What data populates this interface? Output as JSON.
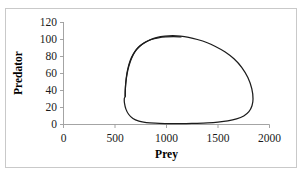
{
  "figure": {
    "border_color": "#c9c9c9",
    "background": "#ffffff"
  },
  "chart_data": {
    "type": "line",
    "title": "",
    "xlabel": "Prey",
    "ylabel": "Predator",
    "xlim": [
      0,
      2000
    ],
    "ylim": [
      0,
      120
    ],
    "xticks": [
      0,
      500,
      1000,
      1500,
      2000
    ],
    "yticks": [
      0,
      20,
      40,
      60,
      80,
      100,
      120
    ],
    "xtick_labels": [
      "0",
      "500",
      "1000",
      "1500",
      "2000"
    ],
    "ytick_labels": [
      "0",
      "20",
      "40",
      "60",
      "80",
      "100",
      "120"
    ],
    "grid": false,
    "legend": false,
    "line_color": "#1c1c1c",
    "series": [
      {
        "name": "predator-prey-limit-cycle",
        "x": [
          600,
          600,
          604,
          612,
          626,
          648,
          680,
          722,
          776,
          840,
          910,
          985,
          1060,
          1135,
          1215,
          1300,
          1390,
          1480,
          1570,
          1655,
          1730,
          1790,
          1828,
          1840,
          1830,
          1800,
          1750,
          1680,
          1595,
          1500,
          1400,
          1295,
          1190,
          1085,
          985,
          890,
          805,
          732,
          674,
          632,
          606,
          592,
          590,
          596,
          600
        ],
        "y": [
          33,
          40,
          48,
          57,
          66,
          75,
          83,
          90,
          95,
          99,
          102,
          103.5,
          104,
          103.5,
          102,
          99.5,
          96,
          91,
          85,
          77,
          67,
          55,
          42,
          30,
          22,
          15,
          10,
          6.5,
          4.2,
          2.8,
          1.9,
          1.4,
          1.1,
          1.0,
          1.1,
          1.5,
          2.3,
          4.0,
          7.0,
          12,
          18,
          25,
          30,
          32,
          33
        ]
      },
      {
        "name": "predator-prey-inner-approach",
        "x": [
          598,
          600,
          606,
          617,
          634,
          659,
          693,
          736,
          789,
          852,
          921,
          994,
          1068,
          1140
        ],
        "y": [
          33,
          41,
          50,
          59,
          68,
          77,
          85,
          91,
          96,
          99.5,
          101.5,
          102.5,
          102.8,
          102.5
        ]
      }
    ]
  },
  "axes": {
    "x_title": "Prey",
    "y_title": "Predator"
  }
}
